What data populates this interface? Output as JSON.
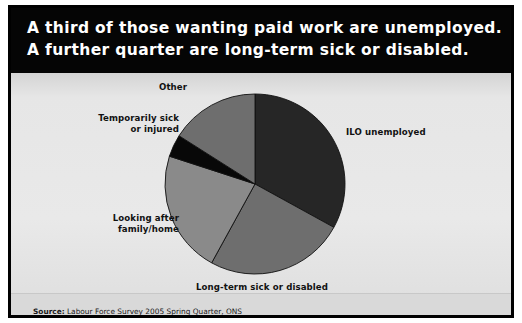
{
  "header": {
    "line1": "A third of those wanting paid work are unemployed.",
    "line2": "A further quarter are long-term sick or disabled.",
    "background": "#050505",
    "text_color": "#ffffff"
  },
  "source": {
    "keyword": "Source:",
    "text": " Labour Force Survey 2005 Spring Quarter, ONS"
  },
  "labels": {
    "ilo": "ILO unemployed",
    "other": "Other",
    "temporarily_sick_line1": "Temporarily sick",
    "temporarily_sick_line2": "or injured",
    "looking_after_line1": "Looking after",
    "looking_after_line2": "family/home",
    "long_term": "Long-term sick or disabled"
  },
  "chart_data": {
    "type": "pie",
    "title": "A third of those wanting paid work are unemployed. A further quarter are long-term sick or disabled.",
    "categories": [
      "ILO unemployed",
      "Long-term sick or disabled",
      "Looking after family/home",
      "Temporarily sick or injured",
      "Other"
    ],
    "values": [
      33,
      25,
      22,
      4,
      16
    ],
    "unit": "percent",
    "colors": [
      "#262626",
      "#6e6e6e",
      "#8a8a8a",
      "#080808",
      "#6e6e6e"
    ],
    "start_angle_deg": 0,
    "direction": "clockwise",
    "legend": "none",
    "labels_position": "outside-callout",
    "center": {
      "x": 244,
      "y": 176
    },
    "radius": 90
  },
  "style": {
    "panel_background": "#e6e6e6",
    "border_color": "#000000",
    "slice_outline": "#111111"
  }
}
